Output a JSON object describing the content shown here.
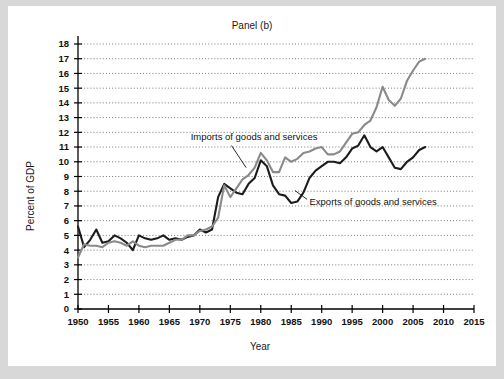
{
  "figure": {
    "title": "Panel (b)",
    "background": "#ffffff",
    "page_background": "#d8d8d8"
  },
  "chart_data": {
    "type": "line",
    "title": "Panel (b)",
    "xlabel": "Year",
    "ylabel": "Percent of GDP",
    "xlim": [
      1950,
      2015
    ],
    "ylim": [
      0,
      18
    ],
    "xticks": [
      1950,
      1955,
      1960,
      1965,
      1970,
      1975,
      1980,
      1985,
      1990,
      1995,
      2000,
      2005,
      2010,
      2015
    ],
    "yticks": [
      0,
      1,
      2,
      3,
      4,
      5,
      6,
      7,
      8,
      9,
      10,
      11,
      12,
      13,
      14,
      15,
      16,
      17,
      18
    ],
    "grid": "horizontal-dotted",
    "legend_position": "inline-annotations",
    "annotations": [
      {
        "text": "Imports of goods and services",
        "series": "Imports of goods and services",
        "text_x": 1968.5,
        "text_y": 11.45,
        "leader_from": [
          1975.2,
          11.1
        ],
        "leader_to": [
          1977.6,
          9.6
        ]
      },
      {
        "text": "Exports of goods and services",
        "series": "Exports of goods and services",
        "text_x": 1988.0,
        "text_y": 7.05,
        "leader_from": [
          1987.6,
          7.45
        ],
        "leader_to": [
          1985.6,
          8.05
        ]
      }
    ],
    "series": [
      {
        "name": "Exports of goods and services",
        "color": "#1c1c1c",
        "width": 2.1,
        "x": [
          1950,
          1951,
          1952,
          1953,
          1954,
          1955,
          1956,
          1957,
          1958,
          1959,
          1960,
          1961,
          1962,
          1963,
          1964,
          1965,
          1966,
          1967,
          1968,
          1969,
          1970,
          1971,
          1972,
          1973,
          1974,
          1975,
          1976,
          1977,
          1978,
          1979,
          1980,
          1981,
          1982,
          1983,
          1984,
          1985,
          1986,
          1987,
          1988,
          1989,
          1990,
          1991,
          1992,
          1993,
          1994,
          1995,
          1996,
          1997,
          1998,
          1999,
          2000,
          2001,
          2002,
          2003,
          2004,
          2005,
          2006,
          2007
        ],
        "values": [
          5.6,
          4.2,
          4.7,
          5.4,
          4.5,
          4.6,
          5.0,
          4.8,
          4.5,
          4.0,
          5.0,
          4.8,
          4.7,
          4.8,
          5.0,
          4.7,
          4.8,
          4.7,
          4.9,
          5.0,
          5.4,
          5.2,
          5.4,
          7.6,
          8.5,
          8.2,
          7.9,
          7.8,
          8.5,
          8.9,
          10.1,
          9.7,
          8.4,
          7.8,
          7.7,
          7.2,
          7.3,
          7.9,
          8.9,
          9.4,
          9.7,
          10.0,
          10.0,
          9.9,
          10.3,
          10.9,
          11.1,
          11.8,
          11.0,
          10.7,
          11.0,
          10.3,
          9.6,
          9.5,
          10.0,
          10.3,
          10.8,
          11.0
        ]
      },
      {
        "name": "Imports of goods and services",
        "color": "#8a8a8a",
        "width": 2.1,
        "x": [
          1950,
          1951,
          1952,
          1953,
          1954,
          1955,
          1956,
          1957,
          1958,
          1959,
          1960,
          1961,
          1962,
          1963,
          1964,
          1965,
          1966,
          1967,
          1968,
          1969,
          1970,
          1971,
          1972,
          1973,
          1974,
          1975,
          1976,
          1977,
          1978,
          1979,
          1980,
          1981,
          1982,
          1983,
          1984,
          1985,
          1986,
          1987,
          1988,
          1989,
          1990,
          1991,
          1992,
          1993,
          1994,
          1995,
          1996,
          1997,
          1998,
          1999,
          2000,
          2001,
          2002,
          2003,
          2004,
          2005,
          2006,
          2007
        ],
        "values": [
          3.5,
          4.4,
          4.3,
          4.3,
          4.2,
          4.5,
          4.6,
          4.5,
          4.3,
          4.6,
          4.3,
          4.2,
          4.3,
          4.3,
          4.3,
          4.5,
          4.7,
          4.7,
          5.0,
          5.0,
          5.3,
          5.4,
          5.6,
          6.2,
          8.4,
          7.6,
          8.2,
          8.8,
          9.1,
          9.6,
          10.6,
          10.1,
          9.3,
          9.3,
          10.3,
          10.0,
          10.2,
          10.6,
          10.7,
          10.9,
          11.0,
          10.5,
          10.5,
          10.7,
          11.3,
          11.9,
          12.0,
          12.5,
          12.8,
          13.7,
          15.1,
          14.2,
          13.8,
          14.3,
          15.5,
          16.2,
          16.8,
          17.0
        ]
      }
    ]
  },
  "axes": {
    "x_axis_label": "Year",
    "y_axis_label": "Percent of GDP",
    "x_tick_labels": [
      "1950",
      "1955",
      "1960",
      "1965",
      "1970",
      "1975",
      "1980",
      "1985",
      "1990",
      "1995",
      "2000",
      "2005",
      "2010",
      "2015"
    ],
    "y_tick_labels": [
      "0",
      "1",
      "2",
      "3",
      "4",
      "5",
      "6",
      "7",
      "8",
      "9",
      "10",
      "11",
      "12",
      "13",
      "14",
      "15",
      "16",
      "17",
      "18"
    ]
  }
}
